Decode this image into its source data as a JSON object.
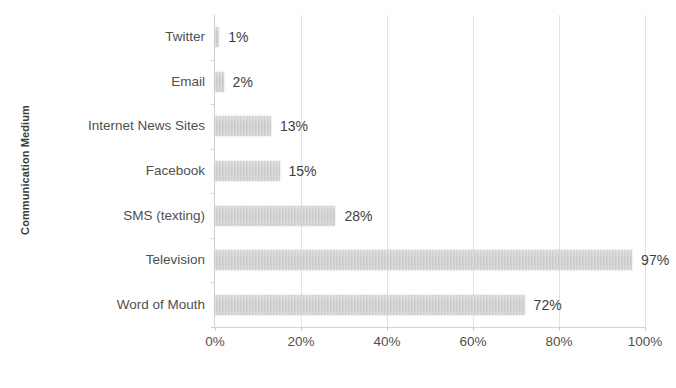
{
  "chart_data": {
    "type": "bar",
    "orientation": "horizontal",
    "title": "",
    "xlabel": "",
    "ylabel": "Communication Medium",
    "categories": [
      "Twitter",
      "Email",
      "Internet News Sites",
      "Facebook",
      "SMS (texting)",
      "Television",
      "Word of Mouth"
    ],
    "values": [
      1,
      2,
      13,
      15,
      28,
      97,
      72
    ],
    "data_labels": [
      "1%",
      "2%",
      "13%",
      "15%",
      "28%",
      "97%",
      "72%"
    ],
    "xlim": [
      0,
      100
    ],
    "xticks": [
      0,
      20,
      40,
      60,
      80,
      100
    ],
    "xtick_labels": [
      "0%",
      "20%",
      "40%",
      "60%",
      "80%",
      "100%"
    ],
    "grid": "vertical",
    "legend": "none",
    "bar_color": "#c8c8c8",
    "text_color": "#4a4a4a",
    "background_color": "#ffffff"
  }
}
